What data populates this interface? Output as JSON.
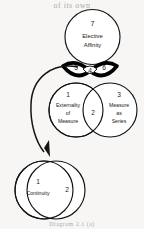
{
  "page": {
    "top_text": "of its own",
    "bottom_caption": "Diagram 2.1 (a)"
  },
  "diagram": {
    "top_circle": {
      "number": "7",
      "label_line1": "Elective",
      "label_line2": "Affinity"
    },
    "lens_left": {
      "number": "5"
    },
    "lens_right": {
      "number": "6"
    },
    "lens_center": {
      "number": "4"
    },
    "middle_left": {
      "number": "1",
      "label_line1": "Externality",
      "label_line2": "of",
      "label_line3": "Measure"
    },
    "middle_right": {
      "number": "3",
      "label_line1": "Measure",
      "label_line2": "as",
      "label_line3": "Series"
    },
    "middle_overlap": {
      "number": "2"
    },
    "bottom_left": {
      "number": "1",
      "label_line1": "Continuity"
    },
    "bottom_overlap": {
      "number": "2"
    },
    "colors": {
      "ink": "#141414",
      "paper": "#f7f6f4",
      "bowtie": "#000000"
    }
  }
}
